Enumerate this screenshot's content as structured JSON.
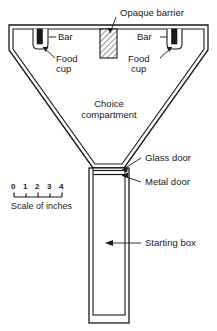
{
  "figure": {
    "name": "choice-apparatus-diagram",
    "type": "apparatus schematic",
    "stroke_color": "#1a1a1a",
    "fill_color": "#ffffff",
    "background": "#ffffff"
  },
  "labels": {
    "opaque_barrier": "Opaque barrier",
    "bar_left": "Bar",
    "bar_right": "Bar",
    "food_cup_left_line1": "Food",
    "food_cup_left_line2": "cup",
    "food_cup_right_line1": "Food",
    "food_cup_right_line2": "cup",
    "choice_compartment_line1": "Choice",
    "choice_compartment_line2": "compartment",
    "glass_door": "Glass door",
    "metal_door": "Metal door",
    "starting_box": "Starting box"
  },
  "scale": {
    "caption": "Scale of inches",
    "ticks": [
      "0",
      "1",
      "2",
      "3",
      "4"
    ],
    "tick_count": 5
  },
  "parts": {
    "opaque_barrier": {
      "hatched": true,
      "name": "opaque-barrier"
    },
    "left_food_cup": {
      "name": "left-food-cup"
    },
    "right_food_cup": {
      "name": "right-food-cup"
    },
    "left_bar": {
      "name": "left-bar",
      "color": "#1a1a1a"
    },
    "right_bar": {
      "name": "right-bar",
      "color": "#1a1a1a"
    },
    "glass_door": {
      "name": "glass-door"
    },
    "metal_door": {
      "name": "metal-door"
    },
    "starting_box": {
      "name": "starting-box"
    },
    "choice_compartment": {
      "name": "choice-compartment"
    }
  }
}
